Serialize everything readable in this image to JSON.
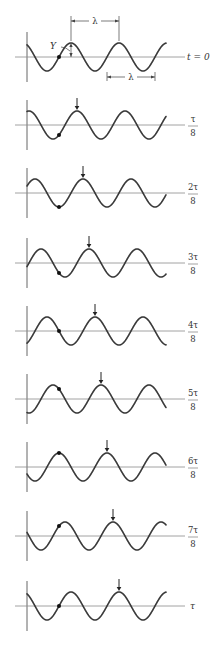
{
  "figure": {
    "width": 216,
    "height": 652,
    "colors": {
      "wave": "#3a3a3a",
      "axis": "#8a8a8a",
      "dot": "#111111",
      "arrow": "#222222",
      "text": "#333333"
    },
    "geometry": {
      "vertical_axis_x": 27,
      "horizontal_axis_x_start": 15,
      "horizontal_axis_x_end": 185,
      "wave_x_start": 27,
      "wave_x_end": 166,
      "wavelength_px": 48,
      "amplitude_px": 14,
      "initial_peak_x": 71,
      "shift_per_panel_px": 6,
      "particle_x": 59,
      "vertical_axis_half_height": 25,
      "label_x": 193
    },
    "annotations": {
      "amplitude_label": "Y",
      "wavelength_label": "λ",
      "top_lambda": {
        "x1": 71,
        "x2": 119,
        "y": 21,
        "label": "λ"
      },
      "bottom_lambda": {
        "x1": 107,
        "x2": 155,
        "y": 77,
        "label": "λ"
      }
    },
    "panels": [
      {
        "index": 0,
        "axis_y": 57,
        "label": "t = 0",
        "label_type": "plain",
        "numerator": "",
        "denominator": "",
        "show_arrow": false
      },
      {
        "index": 1,
        "axis_y": 125,
        "label": "τ/8",
        "label_type": "fraction",
        "numerator": "τ",
        "denominator": "8",
        "show_arrow": true
      },
      {
        "index": 2,
        "axis_y": 193,
        "label": "2τ/8",
        "label_type": "fraction",
        "numerator": "2τ",
        "denominator": "8",
        "show_arrow": true
      },
      {
        "index": 3,
        "axis_y": 263,
        "label": "3τ/8",
        "label_type": "fraction",
        "numerator": "3τ",
        "denominator": "8",
        "show_arrow": true
      },
      {
        "index": 4,
        "axis_y": 331,
        "label": "4τ/8",
        "label_type": "fraction",
        "numerator": "4τ",
        "denominator": "8",
        "show_arrow": true
      },
      {
        "index": 5,
        "axis_y": 399,
        "label": "5τ/8",
        "label_type": "fraction",
        "numerator": "5τ",
        "denominator": "8",
        "show_arrow": true
      },
      {
        "index": 6,
        "axis_y": 467,
        "label": "6τ/8",
        "label_type": "fraction",
        "numerator": "6τ",
        "denominator": "8",
        "show_arrow": true
      },
      {
        "index": 7,
        "axis_y": 536,
        "label": "7τ/8",
        "label_type": "fraction",
        "numerator": "7τ",
        "denominator": "8",
        "show_arrow": true
      },
      {
        "index": 8,
        "axis_y": 606,
        "label": "τ",
        "label_type": "plain",
        "numerator": "",
        "denominator": "",
        "show_arrow": true
      }
    ]
  }
}
